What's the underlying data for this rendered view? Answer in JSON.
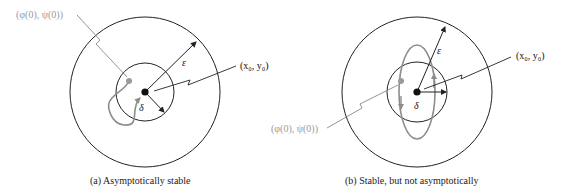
{
  "panels": [
    {
      "id": "a",
      "caption": "(a) Asymptotically stable",
      "initial_point_label": "(φ(0), ψ(0))",
      "equilibrium_label": "(x₀, y₀)",
      "epsilon_label": "ε",
      "delta_label": "δ",
      "trajectory": "spiral into equilibrium"
    },
    {
      "id": "b",
      "caption": "(b) Stable, but not asymptotically",
      "initial_point_label": "(φ(0), ψ(0))",
      "equilibrium_label": "(x₀, y₀)",
      "epsilon_label": "ε",
      "delta_label": "δ",
      "trajectory": "closed orbit around equilibrium"
    }
  ],
  "colors": {
    "line": "#222222",
    "trajectory": "#8c8c8c",
    "initial_label": "#9a9a9a"
  }
}
